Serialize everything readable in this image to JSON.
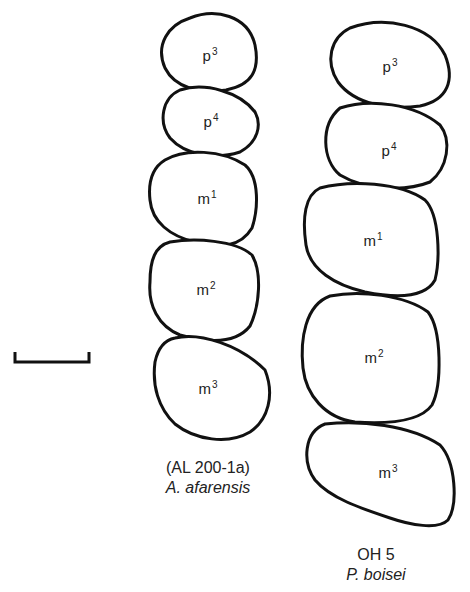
{
  "figure": {
    "scale_bar": {
      "label": ""
    },
    "left_row": {
      "specimen": "(AL 200-1a)",
      "species": "A. afarensis",
      "teeth": [
        {
          "base": "p",
          "sup": "3"
        },
        {
          "base": "p",
          "sup": "4"
        },
        {
          "base": "m",
          "sup": "1"
        },
        {
          "base": "m",
          "sup": "2"
        },
        {
          "base": "m",
          "sup": "3"
        }
      ]
    },
    "right_row": {
      "specimen": "OH 5",
      "species": "P. boisei",
      "teeth": [
        {
          "base": "p",
          "sup": "3"
        },
        {
          "base": "p",
          "sup": "4"
        },
        {
          "base": "m",
          "sup": "1"
        },
        {
          "base": "m",
          "sup": "2"
        },
        {
          "base": "m",
          "sup": "3"
        }
      ]
    }
  }
}
